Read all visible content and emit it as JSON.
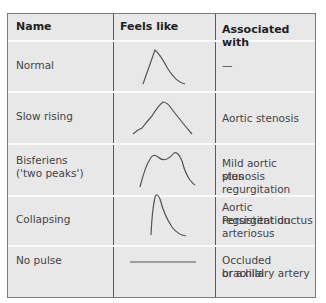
{
  "table": {
    "headers": {
      "name": "Name",
      "feels": "Feels like",
      "assoc": "Associated with"
    },
    "rows": [
      {
        "name": "Normal",
        "waveform": "normal-pulse-waveform",
        "assoc": "—"
      },
      {
        "name": "Slow rising",
        "waveform": "slow-rising-waveform",
        "assoc": "Aortic stenosis"
      },
      {
        "name": "Bisferiens",
        "name2": "('two peaks')",
        "waveform": "bisferiens-waveform",
        "assoc": "Mild aortic stenosis",
        "assoc2": "plus regurgitation"
      },
      {
        "name": "Collapsing",
        "waveform": "collapsing-waveform",
        "assoc": "Aortic regurgitation",
        "assoc2": "Persistent ductus",
        "assoc3": "arteriosus"
      },
      {
        "name": "No pulse",
        "waveform": "flat-line-waveform",
        "assoc": "Occluded brachial",
        "assoc2": "or axillary artery"
      }
    ]
  }
}
